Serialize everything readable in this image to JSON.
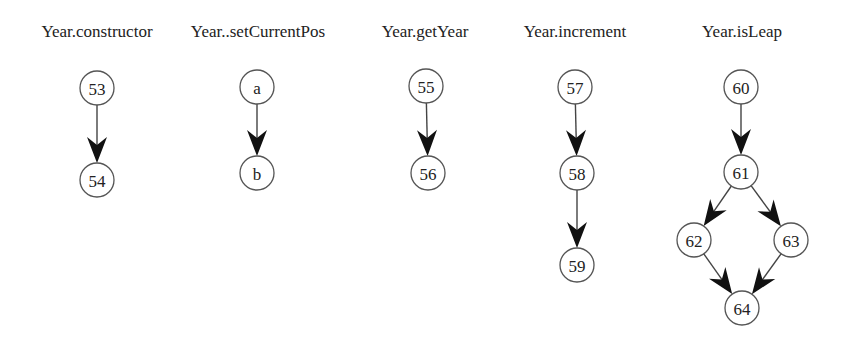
{
  "graphs": [
    {
      "title": "Year.constructor",
      "title_x": 97,
      "nodes": [
        {
          "id": "53",
          "x": 97,
          "y": 88
        },
        {
          "id": "54",
          "x": 97,
          "y": 180
        }
      ],
      "edges": [
        [
          "53",
          "54"
        ]
      ]
    },
    {
      "title": "Year..setCurrentPos",
      "title_x": 258,
      "nodes": [
        {
          "id": "a",
          "x": 257,
          "y": 87
        },
        {
          "id": "b",
          "x": 257,
          "y": 173
        }
      ],
      "edges": [
        [
          "a",
          "b"
        ]
      ]
    },
    {
      "title": "Year.getYear",
      "title_x": 425,
      "nodes": [
        {
          "id": "55",
          "x": 426,
          "y": 86
        },
        {
          "id": "56",
          "x": 428,
          "y": 173
        }
      ],
      "edges": [
        [
          "55",
          "56"
        ]
      ]
    },
    {
      "title": "Year.increment",
      "title_x": 575,
      "nodes": [
        {
          "id": "57",
          "x": 575,
          "y": 87
        },
        {
          "id": "58",
          "x": 577,
          "y": 173
        },
        {
          "id": "59",
          "x": 577,
          "y": 265
        }
      ],
      "edges": [
        [
          "57",
          "58"
        ],
        [
          "58",
          "59"
        ]
      ]
    },
    {
      "title": "Year.isLeap",
      "title_x": 742,
      "nodes": [
        {
          "id": "60",
          "x": 741,
          "y": 87
        },
        {
          "id": "61",
          "x": 741,
          "y": 172
        },
        {
          "id": "62",
          "x": 694,
          "y": 240
        },
        {
          "id": "63",
          "x": 791,
          "y": 240
        },
        {
          "id": "64",
          "x": 742,
          "y": 308
        }
      ],
      "edges": [
        [
          "60",
          "61"
        ],
        [
          "61",
          "62"
        ],
        [
          "61",
          "63"
        ],
        [
          "62",
          "64"
        ],
        [
          "63",
          "64"
        ]
      ]
    }
  ],
  "style": {
    "node_radius": 17,
    "stroke": "#555555",
    "arrow": "#111111"
  }
}
